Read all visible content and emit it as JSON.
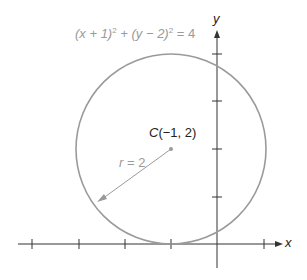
{
  "diagram": {
    "equation": {
      "part1": "(x + 1)",
      "exp1": "2",
      "part2": " + (y − 2)",
      "exp2": "2",
      "part3": " = 4"
    },
    "center_label": {
      "letter": "C",
      "coords": "(−1, 2)"
    },
    "radius_label": {
      "var": "r",
      "value": " = 2"
    },
    "axes": {
      "x_label": "x",
      "y_label": "y"
    },
    "circle": {
      "center": [
        -1,
        2
      ],
      "radius": 2,
      "stroke_color": "#9a9a9a"
    },
    "x_ticks": [
      -4,
      -3,
      -2,
      -1,
      1
    ],
    "y_ticks": [
      1,
      2,
      3,
      4
    ],
    "axis_color": "#333333"
  }
}
